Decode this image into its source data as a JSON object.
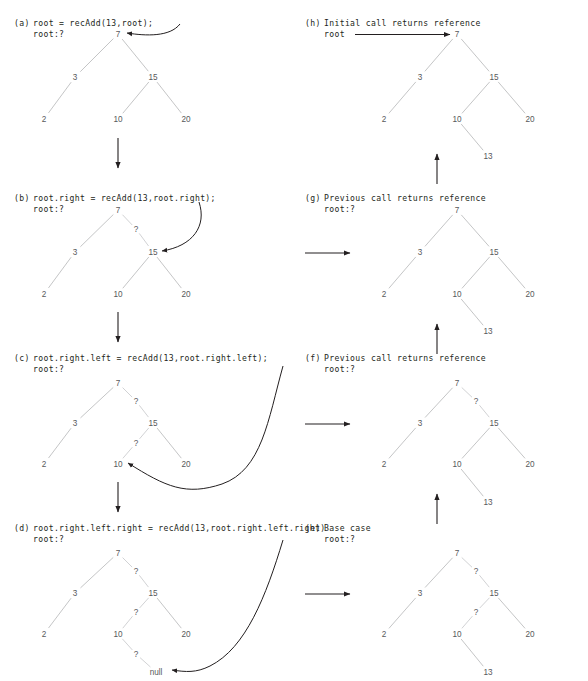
{
  "figure": {
    "value_inserted": "13",
    "colors": {
      "text": "#231f20",
      "node": "#58595b",
      "edge": "#b9babc",
      "arrow": "#231f20",
      "background": "#ffffff"
    }
  },
  "panels": [
    {
      "id": "a",
      "label": "(a)",
      "caption": "root = recAdd(13,root);",
      "root_label": "root:?",
      "column": "left",
      "nodes": [
        {
          "name": "7",
          "x": 118,
          "y": 34
        },
        {
          "name": "3",
          "x": 75,
          "y": 77
        },
        {
          "name": "15",
          "x": 153,
          "y": 77
        },
        {
          "name": "2",
          "x": 44,
          "y": 119
        },
        {
          "name": "10",
          "x": 118,
          "y": 119
        },
        {
          "name": "20",
          "x": 186,
          "y": 119
        }
      ],
      "edges": [
        {
          "from": "7",
          "to": "3"
        },
        {
          "from": "7",
          "to": "15"
        },
        {
          "from": "3",
          "to": "2"
        },
        {
          "from": "15",
          "to": "10"
        },
        {
          "from": "15",
          "to": "20"
        }
      ],
      "question_marks": [],
      "incoming_arrow": {
        "kind": "curve-from-right",
        "target": "7"
      }
    },
    {
      "id": "b",
      "label": "(b)",
      "caption": "root.right = recAdd(13,root.right);",
      "root_label": "root:?",
      "column": "left",
      "nodes": [
        {
          "name": "7",
          "x": 118,
          "y": 210
        },
        {
          "name": "3",
          "x": 75,
          "y": 252
        },
        {
          "name": "15",
          "x": 153,
          "y": 252
        },
        {
          "name": "2",
          "x": 44,
          "y": 294
        },
        {
          "name": "10",
          "x": 118,
          "y": 294
        },
        {
          "name": "20",
          "x": 186,
          "y": 294
        }
      ],
      "edges": [
        {
          "from": "7",
          "to": "3"
        },
        {
          "from": "3",
          "to": "2"
        },
        {
          "from": "15",
          "to": "10"
        },
        {
          "from": "15",
          "to": "20"
        }
      ],
      "question_marks": [
        {
          "text": "?",
          "x": 136,
          "y": 229,
          "from": "7",
          "to": "15"
        }
      ],
      "incoming_arrow": {
        "kind": "curve-from-right",
        "target": "15"
      }
    },
    {
      "id": "c",
      "label": "(c)",
      "caption": "root.right.left = recAdd(13,root.right.left);",
      "root_label": "root:?",
      "column": "left",
      "nodes": [
        {
          "name": "7",
          "x": 118,
          "y": 383
        },
        {
          "name": "3",
          "x": 75,
          "y": 423
        },
        {
          "name": "15",
          "x": 153,
          "y": 423
        },
        {
          "name": "2",
          "x": 44,
          "y": 464
        },
        {
          "name": "10",
          "x": 118,
          "y": 464
        },
        {
          "name": "20",
          "x": 186,
          "y": 464
        }
      ],
      "edges": [
        {
          "from": "7",
          "to": "3"
        },
        {
          "from": "3",
          "to": "2"
        },
        {
          "from": "15",
          "to": "20"
        }
      ],
      "question_marks": [
        {
          "text": "?",
          "x": 136,
          "y": 401,
          "from": "7",
          "to": "15"
        },
        {
          "text": "?",
          "x": 136,
          "y": 443,
          "from": "15",
          "to": "10"
        }
      ],
      "incoming_arrow": {
        "kind": "curve-swoop",
        "target": "10"
      }
    },
    {
      "id": "d",
      "label": "(d)",
      "caption": "root.right.left.right = recAdd(13,root.right.left.right)",
      "root_label": "root:?",
      "column": "left",
      "nodes": [
        {
          "name": "7",
          "x": 118,
          "y": 553
        },
        {
          "name": "3",
          "x": 75,
          "y": 593
        },
        {
          "name": "15",
          "x": 153,
          "y": 593
        },
        {
          "name": "2",
          "x": 44,
          "y": 634
        },
        {
          "name": "10",
          "x": 118,
          "y": 634
        },
        {
          "name": "20",
          "x": 186,
          "y": 634
        },
        {
          "name": "null",
          "x": 156,
          "y": 672
        }
      ],
      "edges": [
        {
          "from": "7",
          "to": "3"
        },
        {
          "from": "3",
          "to": "2"
        },
        {
          "from": "15",
          "to": "20"
        }
      ],
      "question_marks": [
        {
          "text": "?",
          "x": 136,
          "y": 571,
          "from": "7",
          "to": "15"
        },
        {
          "text": "?",
          "x": 136,
          "y": 612,
          "from": "15",
          "to": "10"
        },
        {
          "text": "?",
          "x": 136,
          "y": 654,
          "from": "10",
          "to": "null"
        }
      ],
      "incoming_arrow": {
        "kind": "curve-swoop-null",
        "target": "null"
      }
    },
    {
      "id": "e",
      "label": "(e)",
      "caption": "Base case",
      "root_label": "root:?",
      "column": "right",
      "nodes": [
        {
          "name": "7",
          "x": 457,
          "y": 553
        },
        {
          "name": "3",
          "x": 420,
          "y": 593
        },
        {
          "name": "15",
          "x": 494,
          "y": 593
        },
        {
          "name": "2",
          "x": 384,
          "y": 634
        },
        {
          "name": "10",
          "x": 457,
          "y": 634
        },
        {
          "name": "20",
          "x": 530,
          "y": 634
        },
        {
          "name": "13",
          "x": 488,
          "y": 672
        }
      ],
      "edges": [
        {
          "from": "7",
          "to": "3"
        },
        {
          "from": "3",
          "to": "2"
        },
        {
          "from": "15",
          "to": "20"
        },
        {
          "from": "10",
          "to": "13"
        }
      ],
      "question_marks": [
        {
          "text": "?",
          "x": 476,
          "y": 571,
          "from": "7",
          "to": "15"
        },
        {
          "text": "?",
          "x": 476,
          "y": 612,
          "from": "15",
          "to": "10"
        }
      ],
      "incoming_arrow": {
        "kind": "horizontal",
        "y": 594
      }
    },
    {
      "id": "f",
      "label": "(f)",
      "caption": "Previous call returns reference",
      "root_label": "root:?",
      "column": "right",
      "nodes": [
        {
          "name": "7",
          "x": 457,
          "y": 383
        },
        {
          "name": "3",
          "x": 420,
          "y": 423
        },
        {
          "name": "15",
          "x": 494,
          "y": 423
        },
        {
          "name": "2",
          "x": 384,
          "y": 464
        },
        {
          "name": "10",
          "x": 457,
          "y": 464
        },
        {
          "name": "20",
          "x": 530,
          "y": 464
        },
        {
          "name": "13",
          "x": 488,
          "y": 502
        }
      ],
      "edges": [
        {
          "from": "7",
          "to": "3"
        },
        {
          "from": "3",
          "to": "2"
        },
        {
          "from": "15",
          "to": "10"
        },
        {
          "from": "15",
          "to": "20"
        },
        {
          "from": "10",
          "to": "13"
        }
      ],
      "question_marks": [
        {
          "text": "?",
          "x": 476,
          "y": 401,
          "from": "7",
          "to": "15"
        }
      ],
      "incoming_arrow": {
        "kind": "horizontal",
        "y": 424
      }
    },
    {
      "id": "g",
      "label": "(g)",
      "caption": "Previous call returns reference",
      "root_label": "root:?",
      "column": "right",
      "nodes": [
        {
          "name": "7",
          "x": 457,
          "y": 210
        },
        {
          "name": "3",
          "x": 420,
          "y": 252
        },
        {
          "name": "15",
          "x": 494,
          "y": 252
        },
        {
          "name": "2",
          "x": 384,
          "y": 294
        },
        {
          "name": "10",
          "x": 457,
          "y": 294
        },
        {
          "name": "20",
          "x": 530,
          "y": 294
        },
        {
          "name": "13",
          "x": 488,
          "y": 331
        }
      ],
      "edges": [
        {
          "from": "7",
          "to": "3"
        },
        {
          "from": "7",
          "to": "15"
        },
        {
          "from": "3",
          "to": "2"
        },
        {
          "from": "15",
          "to": "10"
        },
        {
          "from": "15",
          "to": "20"
        },
        {
          "from": "10",
          "to": "13"
        }
      ],
      "question_marks": [],
      "incoming_arrow": {
        "kind": "horizontal",
        "y": 253
      }
    },
    {
      "id": "h",
      "label": "(h)",
      "caption": "Initial call returns reference",
      "root_label": "root",
      "column": "right",
      "nodes": [
        {
          "name": "7",
          "x": 457,
          "y": 34
        },
        {
          "name": "3",
          "x": 420,
          "y": 77
        },
        {
          "name": "15",
          "x": 494,
          "y": 77
        },
        {
          "name": "2",
          "x": 384,
          "y": 119
        },
        {
          "name": "10",
          "x": 457,
          "y": 119
        },
        {
          "name": "20",
          "x": 530,
          "y": 119
        },
        {
          "name": "13",
          "x": 488,
          "y": 156
        }
      ],
      "edges": [
        {
          "from": "7",
          "to": "3"
        },
        {
          "from": "7",
          "to": "15"
        },
        {
          "from": "3",
          "to": "2"
        },
        {
          "from": "15",
          "to": "10"
        },
        {
          "from": "15",
          "to": "20"
        },
        {
          "from": "10",
          "to": "13"
        }
      ],
      "question_marks": [],
      "incoming_arrow": {
        "kind": "root-pointer",
        "target": "7"
      }
    }
  ],
  "flow_arrows": [
    {
      "name": "a-to-b",
      "kind": "down",
      "x": 118,
      "y1": 138,
      "y2": 168
    },
    {
      "name": "b-to-c",
      "kind": "down",
      "x": 118,
      "y1": 312,
      "y2": 342
    },
    {
      "name": "c-to-d",
      "kind": "down",
      "x": 118,
      "y1": 482,
      "y2": 512
    },
    {
      "name": "d-to-e",
      "kind": "right",
      "x1": 305,
      "x2": 350,
      "y": 594
    },
    {
      "name": "c-to-f",
      "kind": "right",
      "x1": 305,
      "x2": 350,
      "y": 424
    },
    {
      "name": "b-to-g",
      "kind": "right",
      "x1": 305,
      "x2": 350,
      "y": 253
    },
    {
      "name": "e-to-f",
      "kind": "up",
      "x": 437,
      "y1": 524,
      "y2": 494
    },
    {
      "name": "f-to-g",
      "kind": "up",
      "x": 437,
      "y1": 354,
      "y2": 324
    },
    {
      "name": "g-to-h",
      "kind": "up",
      "x": 437,
      "y1": 184,
      "y2": 154
    }
  ],
  "caption_positions": [
    {
      "panel": "a",
      "label_x": 14,
      "caption_x": 33,
      "y": 26,
      "root_x": 33,
      "root_y": 37
    },
    {
      "panel": "b",
      "label_x": 14,
      "caption_x": 33,
      "y": 201,
      "root_x": 33,
      "root_y": 212
    },
    {
      "panel": "c",
      "label_x": 14,
      "caption_x": 33,
      "y": 361,
      "root_x": 33,
      "root_y": 372
    },
    {
      "panel": "d",
      "label_x": 14,
      "caption_x": 33,
      "y": 531,
      "root_x": 33,
      "root_y": 542
    },
    {
      "panel": "e",
      "label_x": 305,
      "caption_x": 324,
      "y": 531,
      "root_x": 324,
      "root_y": 542
    },
    {
      "panel": "f",
      "label_x": 305,
      "caption_x": 324,
      "y": 361,
      "root_x": 324,
      "root_y": 372
    },
    {
      "panel": "g",
      "label_x": 305,
      "caption_x": 324,
      "y": 201,
      "root_x": 324,
      "root_y": 212
    },
    {
      "panel": "h",
      "label_x": 305,
      "caption_x": 324,
      "y": 26,
      "root_x": 324,
      "root_y": 37
    }
  ]
}
